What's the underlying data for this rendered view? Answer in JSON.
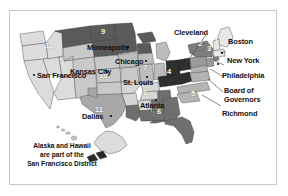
{
  "figure": {
    "type": "map",
    "background_color": "#ffffff",
    "frame_color": "#c8c8c8"
  },
  "note": {
    "line1": "Alaska and Hawaii",
    "line2": "are part of the",
    "line3": "San Francisco District"
  },
  "districts": [
    {
      "number": "1",
      "city": "Boston",
      "fill": "#e8e8e8"
    },
    {
      "number": "2",
      "city": "New York",
      "fill": "#7d7d7d"
    },
    {
      "number": "3",
      "city": "Philadelphia",
      "fill": "#9a9a9a"
    },
    {
      "number": "4",
      "city": "Cleveland",
      "fill": "#2e2e2e"
    },
    {
      "number": "5",
      "city": "Richmond",
      "fill": "#b4b4b4"
    },
    {
      "number": "6",
      "city": "Atlanta",
      "fill": "#6f6f6f"
    },
    {
      "number": "7",
      "city": "Chicago",
      "fill": "#bdbdbd"
    },
    {
      "number": "8",
      "city": "St. Louis",
      "fill": "#d6d6d6"
    },
    {
      "number": "9",
      "city": "Minneapolis",
      "fill": "#5a5a5a"
    },
    {
      "number": "10",
      "city": "Kansas City",
      "fill": "#c9c9c9"
    },
    {
      "number": "11",
      "city": "Dallas",
      "fill": "#a8a8a8"
    },
    {
      "number": "12",
      "city": "San Francisco",
      "fill": "#dcdcdc"
    }
  ],
  "board": {
    "label_line1": "Board of",
    "label_line2": "Governors"
  },
  "city_labels": [
    {
      "name": "Cleveland",
      "text": "Cleveland"
    },
    {
      "name": "Boston",
      "text": "Boston"
    },
    {
      "name": "New York",
      "text": "New York"
    },
    {
      "name": "Philadelphia",
      "text": "Philadelphia"
    },
    {
      "name": "Richmond",
      "text": "Richmond"
    },
    {
      "name": "Atlanta",
      "text": "Atlanta"
    },
    {
      "name": "Minneapolis",
      "text": "Minneapolis"
    },
    {
      "name": "Chicago",
      "text": "Chicago"
    },
    {
      "name": "St. Louis",
      "text": "St. Louis"
    },
    {
      "name": "Kansas City",
      "text": "Kansas City"
    },
    {
      "name": "Dallas",
      "text": "Dallas"
    },
    {
      "name": "San Francisco",
      "text": "San Francisco"
    }
  ]
}
